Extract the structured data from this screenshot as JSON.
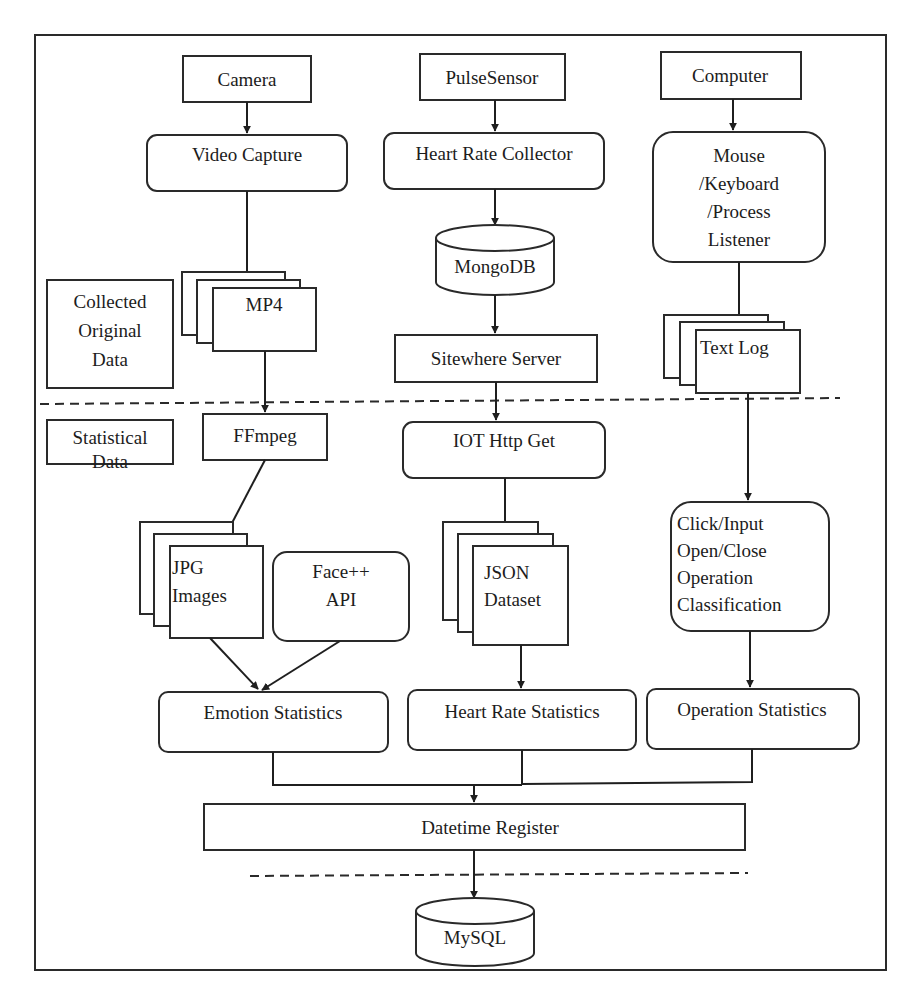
{
  "diagram": {
    "frame": {
      "border_color": "#2a2a2a",
      "background": "#ffffff"
    },
    "sections": {
      "collected": [
        "Collected",
        "Original",
        "Data"
      ],
      "statistical": [
        "Statistical",
        "Data"
      ]
    },
    "sources": {
      "camera": "Camera",
      "pulse": "PulseSensor",
      "computer": "Computer"
    },
    "collectors": {
      "video": "Video Capture",
      "heart": "Heart Rate Collector",
      "listener": [
        "Mouse",
        "/Keyboard",
        "/Process",
        "Listener"
      ]
    },
    "storage": {
      "mp4": "MP4",
      "mongodb": "MongoDB",
      "sitewhere": "Sitewhere Server",
      "textlog": "Text Log"
    },
    "processing": {
      "ffmpeg": "FFmpeg",
      "iot": "IOT Http Get",
      "jpg": [
        "JPG",
        "Images"
      ],
      "faceapi": [
        "Face++",
        "API"
      ],
      "json": [
        "JSON",
        "Dataset"
      ],
      "classify": [
        "Click/Input",
        "Open/Close",
        "Operation",
        "Classification"
      ]
    },
    "statistics": {
      "emotion": "Emotion Statistics",
      "heart": "Heart Rate Statistics",
      "operation": "Operation Statistics"
    },
    "register": "Datetime Register",
    "database": "MySQL"
  }
}
